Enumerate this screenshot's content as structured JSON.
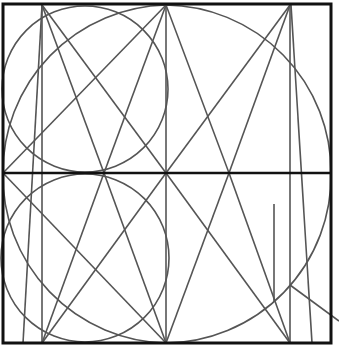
{
  "diagram": {
    "title": "",
    "width": 339,
    "height": 347,
    "colors": {
      "background": "#ffffff",
      "frame": "#111111",
      "line": "#555555"
    },
    "frame": {
      "x": 3,
      "y": 4,
      "w": 328,
      "h": 339,
      "stroke_width": 3
    },
    "midline": {
      "x1": 3,
      "y1": 173,
      "x2": 331,
      "y2": 173,
      "stroke_width": 2.5
    },
    "circles": [
      {
        "name": "small-circle-top",
        "cx": 85,
        "cy": 89,
        "r": 83
      },
      {
        "name": "small-circle-bottom",
        "cx": 85,
        "cy": 258,
        "r": 84
      }
    ],
    "arcs": [
      {
        "name": "large-arc",
        "d": "M 3 173 A 167 167 0 0 1 166 5 A 167 167 0 0 1 331 173 A 167 167 0 0 1 166 343 A 167 167 0 0 1 3 173"
      }
    ],
    "lines": [
      {
        "name": "vertical-42",
        "x1": 42,
        "y1": 5,
        "x2": 42,
        "y2": 343
      },
      {
        "name": "slant-left",
        "x1": 42,
        "y1": 5,
        "x2": 23,
        "y2": 343
      },
      {
        "name": "vertical-166",
        "x1": 166,
        "y1": 5,
        "x2": 166,
        "y2": 343
      },
      {
        "name": "vertical-290",
        "x1": 290,
        "y1": 5,
        "x2": 290,
        "y2": 343
      },
      {
        "name": "slant-right",
        "x1": 291,
        "y1": 5,
        "x2": 312,
        "y2": 343
      },
      {
        "name": "short-vertical",
        "x1": 274,
        "y1": 204,
        "x2": 274,
        "y2": 302
      },
      {
        "name": "tail-line",
        "x1": 290,
        "y1": 285,
        "x2": 339,
        "y2": 321
      },
      {
        "name": "top-a1",
        "x1": 42,
        "y1": 5,
        "x2": 104,
        "y2": 173
      },
      {
        "name": "top-a2",
        "x1": 42,
        "y1": 5,
        "x2": 166,
        "y2": 173
      },
      {
        "name": "top-b1",
        "x1": 166,
        "y1": 5,
        "x2": 3,
        "y2": 173
      },
      {
        "name": "top-b2",
        "x1": 166,
        "y1": 5,
        "x2": 104,
        "y2": 173
      },
      {
        "name": "top-b3",
        "x1": 166,
        "y1": 5,
        "x2": 229,
        "y2": 173
      },
      {
        "name": "top-c1",
        "x1": 290,
        "y1": 5,
        "x2": 166,
        "y2": 173
      },
      {
        "name": "top-c2",
        "x1": 290,
        "y1": 5,
        "x2": 229,
        "y2": 173
      },
      {
        "name": "bot-a1",
        "x1": 104,
        "y1": 173,
        "x2": 42,
        "y2": 343
      },
      {
        "name": "bot-a2",
        "x1": 104,
        "y1": 173,
        "x2": 166,
        "y2": 343
      },
      {
        "name": "bot-b1",
        "x1": 3,
        "y1": 173,
        "x2": 166,
        "y2": 343
      },
      {
        "name": "bot-b2",
        "x1": 166,
        "y1": 173,
        "x2": 42,
        "y2": 343
      },
      {
        "name": "bot-b3",
        "x1": 166,
        "y1": 173,
        "x2": 290,
        "y2": 343
      },
      {
        "name": "bot-c1",
        "x1": 229,
        "y1": 173,
        "x2": 166,
        "y2": 343
      },
      {
        "name": "bot-c2",
        "x1": 229,
        "y1": 173,
        "x2": 290,
        "y2": 343
      }
    ]
  }
}
